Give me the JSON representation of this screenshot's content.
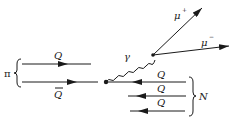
{
  "diagram": {
    "type": "feynman-diagram",
    "colors": {
      "ink": "#1a1a1a",
      "background": "#ffffff"
    },
    "labels": {
      "pion": "π",
      "quark": "Q",
      "antiquark": "Q",
      "photon": "γ",
      "mu_plus_base": "μ",
      "mu_plus_sup": "+",
      "mu_minus_base": "μ",
      "mu_minus_sup": "−",
      "nucleon": "N",
      "nucleon_quarks": [
        "Q",
        "Q",
        "Q"
      ]
    },
    "nodes": [
      {
        "id": "annihilation-vertex",
        "x": 106,
        "y": 82
      },
      {
        "id": "decay-vertex",
        "x": 153,
        "y": 54
      }
    ],
    "edges": [
      {
        "from": "pion-quark",
        "to": "right",
        "style": "arrow"
      },
      {
        "from": "pion-antiquark",
        "to": "annihilation-vertex",
        "style": "arrow"
      },
      {
        "from": "annihilation-vertex",
        "to": "decay-vertex",
        "style": "wavy",
        "label": "γ"
      },
      {
        "from": "decay-vertex",
        "to": "mu-plus",
        "style": "arrow",
        "label": "μ+"
      },
      {
        "from": "decay-vertex",
        "to": "mu-minus",
        "style": "arrow",
        "label": "μ−"
      },
      {
        "from": "nucleon-quark-1",
        "to": "left",
        "style": "arrow"
      },
      {
        "from": "nucleon-quark-2",
        "to": "left",
        "style": "arrow"
      },
      {
        "from": "nucleon-quark-3",
        "to": "left",
        "style": "arrow"
      }
    ]
  }
}
